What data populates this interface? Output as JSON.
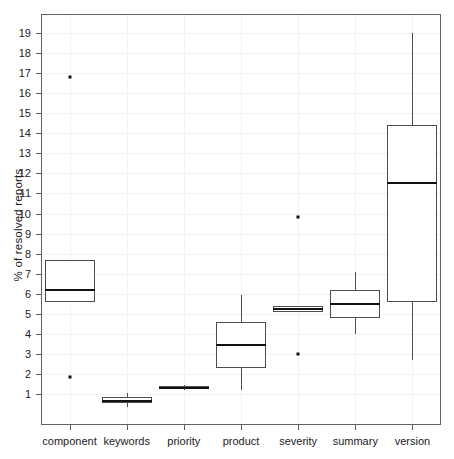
{
  "chart_data": {
    "type": "box",
    "title": "",
    "xlabel": "",
    "ylabel": "% of resolved reports",
    "ylim": [
      0.25,
      19.6
    ],
    "grid": true,
    "legend": "none",
    "y_ticks": [
      1,
      2,
      3,
      4,
      5,
      6,
      7,
      8,
      9,
      10,
      11,
      12,
      13,
      14,
      15,
      16,
      17,
      18,
      19
    ],
    "categories": [
      "component",
      "keywords",
      "priority",
      "product",
      "severity",
      "summary",
      "version"
    ],
    "boxes": [
      {
        "category": "component",
        "whisker_low": 5.6,
        "q1": 5.6,
        "median": 6.2,
        "q3": 7.7,
        "whisker_high": 7.7,
        "outliers": [
          16.8,
          1.85
        ]
      },
      {
        "category": "keywords",
        "whisker_low": 0.35,
        "q1": 0.55,
        "median": 0.65,
        "q3": 0.85,
        "whisker_high": 1.05,
        "outliers": []
      },
      {
        "category": "priority",
        "whisker_low": 1.2,
        "q1": 1.25,
        "median": 1.3,
        "q3": 1.4,
        "whisker_high": 1.45,
        "outliers": []
      },
      {
        "category": "product",
        "whisker_low": 1.2,
        "q1": 2.3,
        "median": 3.45,
        "q3": 4.6,
        "whisker_high": 5.95,
        "outliers": []
      },
      {
        "category": "severity",
        "whisker_low": 5.1,
        "q1": 5.1,
        "median": 5.25,
        "q3": 5.4,
        "whisker_high": 5.4,
        "outliers": [
          9.85,
          3.0
        ]
      },
      {
        "category": "summary",
        "whisker_low": 4.0,
        "q1": 4.8,
        "median": 5.5,
        "q3": 6.2,
        "whisker_high": 7.1,
        "outliers": []
      },
      {
        "category": "version",
        "whisker_low": 2.7,
        "q1": 5.6,
        "median": 11.5,
        "q3": 14.4,
        "whisker_high": 19.0,
        "outliers": []
      }
    ]
  },
  "colors": {
    "box_stroke": "#4d4d4d",
    "median": "#111111",
    "frame": "#636363",
    "grid": "#f0f0f0",
    "outlier": "#111111",
    "background": "#ffffff"
  }
}
